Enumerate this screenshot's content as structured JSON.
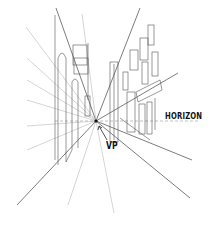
{
  "diagram": {
    "type": "one-point perspective street sketch",
    "labels": {
      "horizon": "HORIZON",
      "vanishing_point": "VP"
    },
    "vanishing_point": {
      "x": 96,
      "y": 121
    },
    "colors": {
      "line": "#333333",
      "light_line": "#9a9a9a",
      "horizon_line": "#8a8a8a",
      "text": "#111111",
      "background": "#ffffff"
    }
  }
}
